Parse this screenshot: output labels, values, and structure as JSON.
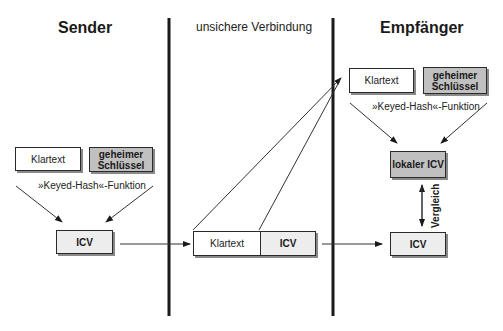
{
  "sender": {
    "heading": "Sender",
    "plaintext_label": "Klartext",
    "key_label": "geheimer Schlüssel",
    "function_label": "»Keyed-Hash«-Funktion",
    "icv_label": "ICV"
  },
  "channel": {
    "heading": "unsichere Verbindung",
    "plaintext_label": "Klartext",
    "icv_label": "ICV"
  },
  "receiver": {
    "heading": "Empfänger",
    "plaintext_label": "Klartext",
    "key_label": "geheimer Schlüssel",
    "function_label": "»Keyed-Hash«-Funktion",
    "local_icv_label": "lokaler ICV",
    "compare_label": "Vergleich",
    "icv_label": "ICV"
  },
  "colors": {
    "key_fill": "#c0c0c0",
    "icv_fill": "#ededed",
    "line": "#1a1a1a"
  }
}
